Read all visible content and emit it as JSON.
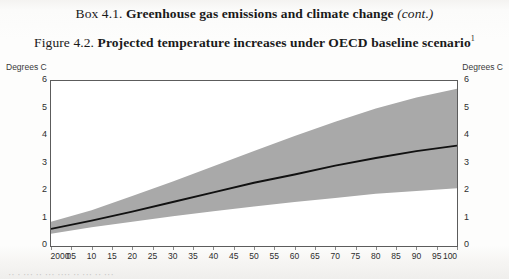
{
  "box_heading": {
    "lead": "Box 4.1.",
    "bold": "Greenhouse gas emissions and climate change",
    "italic": "(cont.)"
  },
  "figure_heading": {
    "lead": "Figure 4.2.",
    "bold": "Projected temperature increases under OECD baseline scenario",
    "footnote_marker": "1"
  },
  "chart_data": {
    "type": "area",
    "title": "Projected temperature increases under OECD baseline scenario",
    "xlabel": "",
    "ylabel": "Degrees C",
    "ylabel_right": "Degrees C",
    "ylim": [
      0,
      6
    ],
    "xlim": [
      2000,
      2100
    ],
    "grid": false,
    "legend": "none",
    "ytick_labels": [
      "0",
      "1",
      "2",
      "3",
      "4",
      "5",
      "6"
    ],
    "ytick_values": [
      0,
      1,
      2,
      3,
      4,
      5,
      6
    ],
    "xtick_labels": [
      "2000",
      "05",
      "10",
      "15",
      "20",
      "25",
      "30",
      "35",
      "40",
      "45",
      "50",
      "55",
      "60",
      "65",
      "70",
      "75",
      "80",
      "85",
      "90",
      "95",
      "100"
    ],
    "xtick_values": [
      2000,
      2005,
      2010,
      2015,
      2020,
      2025,
      2030,
      2035,
      2040,
      2045,
      2050,
      2055,
      2060,
      2065,
      2070,
      2075,
      2080,
      2085,
      2090,
      2095,
      2100
    ],
    "series": [
      {
        "name": "Projected temperature increase (central estimate)",
        "style": "line",
        "color": "#111111",
        "x": [
          2000,
          2010,
          2020,
          2030,
          2040,
          2050,
          2060,
          2070,
          2080,
          2090,
          2100
        ],
        "values": [
          0.62,
          0.92,
          1.25,
          1.6,
          1.95,
          2.3,
          2.6,
          2.92,
          3.2,
          3.45,
          3.65
        ]
      },
      {
        "name": "Uncertainty range (upper bound)",
        "style": "band-upper",
        "color": "#a8a8a8",
        "x": [
          2000,
          2010,
          2020,
          2030,
          2040,
          2050,
          2060,
          2070,
          2080,
          2090,
          2100
        ],
        "values": [
          0.88,
          1.3,
          1.82,
          2.35,
          2.9,
          3.45,
          4.0,
          4.52,
          5.0,
          5.4,
          5.72
        ]
      },
      {
        "name": "Uncertainty range (lower bound)",
        "style": "band-lower",
        "color": "#a8a8a8",
        "x": [
          2000,
          2010,
          2020,
          2030,
          2040,
          2050,
          2060,
          2070,
          2080,
          2090,
          2100
        ],
        "values": [
          0.45,
          0.68,
          0.88,
          1.08,
          1.26,
          1.44,
          1.6,
          1.75,
          1.9,
          2.0,
          2.1
        ]
      }
    ],
    "band_fill_color": "#a9a9a9",
    "line_color": "#111111",
    "frame_color": "#5c5c5c",
    "plot_background": "#ffffff"
  },
  "page_fragment": "··  ·  ···   ··   ···  ····   ··  ···  ··   ···"
}
